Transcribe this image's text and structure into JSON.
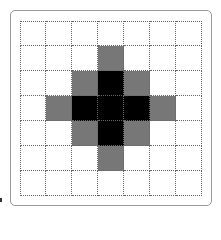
{
  "diagram": {
    "type": "grid",
    "rows": 7,
    "cols": 7,
    "legend": {
      "0": "white",
      "1": "gray",
      "2": "black"
    },
    "colors": {
      "white": "#ffffff",
      "gray": "#777777",
      "black": "#000000",
      "gridline": "#666666",
      "frame": "#9a9a9a"
    },
    "cells": [
      [
        0,
        0,
        0,
        0,
        0,
        0,
        0
      ],
      [
        0,
        0,
        0,
        1,
        0,
        0,
        0
      ],
      [
        0,
        0,
        1,
        2,
        1,
        0,
        0
      ],
      [
        0,
        1,
        2,
        2,
        2,
        1,
        0
      ],
      [
        0,
        0,
        1,
        2,
        1,
        0,
        0
      ],
      [
        0,
        0,
        0,
        1,
        0,
        0,
        0
      ],
      [
        0,
        0,
        0,
        0,
        0,
        0,
        0
      ]
    ]
  }
}
